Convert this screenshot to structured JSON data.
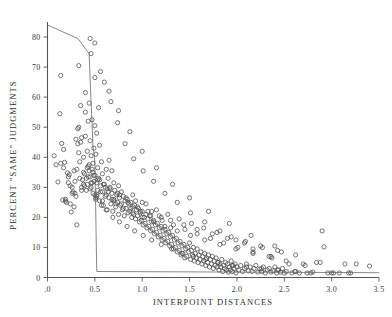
{
  "figure": {
    "background": "#ffffff",
    "marker_color": "#4a4a4a",
    "line_color": "#6a6a6a",
    "axis_color": "#555555"
  },
  "chart_data": {
    "type": "scatter",
    "title": "",
    "xlabel": "INTERPOINT  DISTANCES",
    "ylabel": "PERCENT \"SAME\" JUDGMENTS",
    "xlim": [
      0.0,
      3.5
    ],
    "ylim": [
      0,
      85
    ],
    "grid": false,
    "legend": null,
    "xticks": [
      0.0,
      0.5,
      1.0,
      1.5,
      2.0,
      2.5,
      3.0,
      3.5
    ],
    "xticklabels": [
      ".0",
      "0.5",
      "1.0",
      "1.5",
      "2.0",
      "2.5",
      "3.0",
      "3.5"
    ],
    "yticks": [
      0,
      10,
      20,
      30,
      40,
      50,
      60,
      70,
      80
    ],
    "yticklabels": [
      "0",
      "10",
      "20",
      "30",
      "40",
      "50",
      "60",
      "70",
      "80"
    ],
    "marker": "open-circle",
    "marker_size": 4.2,
    "series": [
      {
        "name": "observations",
        "x": [
          0.07,
          0.09,
          0.11,
          0.13,
          0.14,
          0.15,
          0.16,
          0.17,
          0.18,
          0.19,
          0.2,
          0.21,
          0.22,
          0.23,
          0.24,
          0.25,
          0.26,
          0.27,
          0.28,
          0.29,
          0.3,
          0.3,
          0.31,
          0.32,
          0.32,
          0.33,
          0.34,
          0.35,
          0.35,
          0.36,
          0.37,
          0.38,
          0.38,
          0.39,
          0.4,
          0.4,
          0.41,
          0.42,
          0.42,
          0.43,
          0.43,
          0.44,
          0.44,
          0.45,
          0.45,
          0.46,
          0.46,
          0.47,
          0.47,
          0.48,
          0.48,
          0.49,
          0.49,
          0.5,
          0.5,
          0.5,
          0.51,
          0.51,
          0.52,
          0.52,
          0.53,
          0.53,
          0.54,
          0.55,
          0.55,
          0.56,
          0.57,
          0.58,
          0.58,
          0.59,
          0.6,
          0.61,
          0.62,
          0.62,
          0.63,
          0.64,
          0.65,
          0.65,
          0.66,
          0.67,
          0.68,
          0.68,
          0.69,
          0.7,
          0.7,
          0.71,
          0.72,
          0.73,
          0.74,
          0.75,
          0.75,
          0.76,
          0.77,
          0.78,
          0.79,
          0.8,
          0.81,
          0.82,
          0.83,
          0.84,
          0.85,
          0.86,
          0.87,
          0.88,
          0.89,
          0.9,
          0.9,
          0.91,
          0.92,
          0.93,
          0.94,
          0.95,
          0.96,
          0.97,
          0.98,
          0.99,
          1.0,
          1.0,
          1.01,
          1.02,
          1.03,
          1.04,
          1.05,
          1.06,
          1.07,
          1.08,
          1.09,
          1.1,
          1.1,
          1.11,
          1.12,
          1.13,
          1.14,
          1.15,
          1.16,
          1.17,
          1.18,
          1.19,
          1.2,
          1.2,
          1.21,
          1.22,
          1.23,
          1.24,
          1.25,
          1.26,
          1.27,
          1.28,
          1.29,
          1.3,
          1.3,
          1.31,
          1.32,
          1.33,
          1.34,
          1.35,
          1.36,
          1.37,
          1.38,
          1.39,
          1.4,
          1.41,
          1.42,
          1.43,
          1.44,
          1.45,
          1.46,
          1.47,
          1.48,
          1.49,
          1.5,
          1.51,
          1.52,
          1.53,
          1.54,
          1.55,
          1.56,
          1.57,
          1.58,
          1.59,
          1.6,
          1.61,
          1.62,
          1.63,
          1.64,
          1.65,
          1.66,
          1.67,
          1.68,
          1.69,
          1.7,
          1.71,
          1.72,
          1.73,
          1.74,
          1.75,
          1.76,
          1.77,
          1.78,
          1.79,
          1.8,
          1.81,
          1.82,
          1.83,
          1.84,
          1.85,
          1.86,
          1.87,
          1.88,
          1.89,
          1.9,
          1.91,
          1.92,
          1.93,
          1.94,
          1.95,
          1.96,
          1.97,
          1.98,
          1.99,
          2.0,
          2.02,
          2.04,
          2.06,
          2.08,
          2.1,
          2.12,
          2.14,
          2.16,
          2.18,
          2.2,
          2.22,
          2.24,
          2.26,
          2.28,
          2.3,
          2.32,
          2.34,
          2.36,
          2.38,
          2.4,
          2.42,
          2.44,
          2.46,
          2.48,
          2.5,
          2.52,
          2.55,
          2.58,
          2.62,
          2.66,
          2.7,
          2.74,
          2.78,
          2.84,
          2.88,
          2.92,
          2.96,
          3.02,
          3.08,
          3.14,
          3.2,
          3.26,
          3.4,
          0.14,
          0.17,
          0.22,
          0.26,
          0.31,
          0.33,
          0.36,
          0.39,
          0.41,
          0.44,
          0.46,
          0.48,
          0.51,
          0.53,
          0.56,
          0.59,
          0.62,
          0.66,
          0.7,
          0.74,
          0.78,
          0.83,
          0.88,
          0.93,
          0.98,
          1.04,
          1.09,
          1.15,
          1.21,
          1.27,
          1.33,
          1.39,
          1.45,
          1.52,
          1.58,
          1.65,
          1.72,
          1.79,
          1.86,
          1.94,
          2.01,
          2.09,
          2.17,
          2.25,
          2.34,
          2.43,
          2.52,
          2.62,
          2.72,
          2.9,
          0.19,
          0.24,
          0.29,
          0.34,
          0.38,
          0.42,
          0.45,
          0.49,
          0.52,
          0.55,
          0.58,
          0.61,
          0.64,
          0.68,
          0.72,
          0.76,
          0.8,
          0.85,
          0.9,
          0.95,
          1.0,
          1.06,
          1.12,
          1.18,
          1.24,
          1.3,
          1.37,
          1.44,
          1.51,
          1.58,
          1.66,
          1.74,
          1.82,
          1.9,
          1.99,
          2.08,
          2.17,
          2.27,
          2.37,
          2.47,
          0.28,
          0.36,
          0.43,
          0.47,
          0.52,
          0.57,
          0.63,
          0.69,
          0.76,
          0.84,
          0.92,
          1.01,
          1.1,
          1.2,
          1.31,
          1.42,
          1.54,
          1.67,
          1.8,
          1.95,
          2.1,
          2.26,
          2.43,
          2.61,
          2.8,
          3.0,
          3.18,
          0.33,
          0.4,
          0.46,
          0.5,
          0.54,
          0.6,
          0.67,
          0.74,
          0.82,
          0.91,
          1.01,
          1.12,
          1.24,
          1.37,
          1.51,
          1.66,
          1.82,
          1.99,
          2.17,
          2.36,
          0.45,
          0.5,
          0.56,
          0.65,
          0.75,
          0.87,
          1.0,
          1.15,
          1.32,
          1.5,
          1.7,
          1.92,
          2.15,
          2.4
        ],
        "y": [
          40.5,
          37.5,
          31.8,
          54.5,
          67.2,
          44.6,
          25.8,
          42.6,
          38.3,
          25.4,
          25.0,
          34.8,
          31.5,
          34.2,
          24.5,
          21.8,
          30.0,
          28.5,
          35.5,
          32.0,
          27.0,
          46.0,
          17.5,
          44.5,
          49.5,
          50.0,
          38.5,
          45.0,
          57.2,
          46.5,
          32.5,
          40.0,
          35.0,
          30.5,
          55.0,
          47.0,
          33.0,
          31.0,
          42.0,
          52.0,
          37.0,
          35.5,
          58.0,
          33.5,
          45.5,
          40.5,
          30.0,
          36.0,
          52.5,
          28.0,
          38.0,
          32.0,
          43.0,
          27.5,
          34.0,
          50.5,
          26.0,
          41.0,
          31.5,
          48.0,
          36.5,
          29.0,
          33.0,
          25.5,
          44.0,
          30.5,
          38.5,
          28.5,
          34.5,
          24.0,
          31.0,
          27.0,
          36.0,
          22.5,
          29.5,
          33.0,
          26.5,
          39.0,
          30.0,
          24.5,
          28.0,
          35.5,
          22.0,
          31.5,
          26.0,
          29.0,
          23.5,
          27.5,
          25.0,
          30.5,
          21.0,
          26.5,
          24.0,
          28.5,
          22.5,
          27.0,
          20.5,
          25.5,
          23.0,
          26.0,
          21.5,
          24.5,
          22.0,
          25.0,
          20.0,
          23.5,
          27.5,
          21.0,
          24.0,
          19.5,
          22.5,
          20.5,
          23.0,
          18.5,
          21.5,
          19.0,
          22.0,
          25.0,
          17.5,
          20.0,
          18.0,
          21.0,
          16.5,
          19.5,
          17.0,
          20.5,
          15.5,
          18.5,
          22.0,
          16.0,
          19.0,
          14.5,
          17.5,
          15.0,
          18.0,
          13.5,
          16.5,
          14.0,
          17.0,
          20.0,
          12.5,
          15.5,
          13.0,
          16.0,
          11.5,
          14.5,
          12.0,
          15.0,
          10.5,
          13.5,
          16.5,
          11.0,
          14.0,
          9.5,
          12.5,
          10.0,
          13.0,
          8.5,
          11.5,
          9.0,
          12.0,
          7.5,
          10.5,
          8.0,
          11.0,
          6.5,
          9.5,
          7.0,
          10.0,
          8.5,
          11.5,
          6.0,
          9.0,
          7.5,
          10.0,
          5.5,
          8.0,
          6.5,
          9.5,
          5.0,
          7.5,
          6.0,
          8.5,
          4.5,
          7.0,
          5.5,
          8.0,
          4.0,
          6.5,
          5.0,
          7.5,
          3.5,
          6.0,
          4.5,
          7.0,
          3.0,
          5.5,
          4.0,
          6.5,
          3.5,
          5.0,
          2.5,
          4.5,
          3.5,
          6.0,
          2.0,
          4.0,
          3.0,
          5.0,
          2.5,
          4.5,
          1.8,
          3.5,
          2.5,
          5.5,
          2.0,
          4.0,
          3.0,
          4.5,
          1.5,
          3.5,
          2.5,
          4.0,
          2.0,
          3.0,
          4.5,
          2.2,
          3.5,
          2.0,
          3.0,
          4.0,
          1.8,
          2.8,
          2.0,
          3.5,
          1.5,
          2.5,
          3.0,
          1.8,
          2.2,
          3.5,
          1.5,
          2.5,
          1.8,
          3.0,
          1.5,
          2.0,
          4.5,
          1.5,
          2.0,
          1.5,
          4.5,
          1.5,
          1.5,
          5.0,
          5.0,
          10.2,
          1.5,
          1.5,
          1.5,
          4.5,
          1.5,
          4.5,
          3.8,
          38.0,
          36.5,
          33.5,
          28.0,
          36.0,
          41.5,
          30.0,
          34.5,
          29.0,
          37.5,
          31.5,
          35.0,
          26.5,
          32.5,
          28.5,
          31.0,
          27.5,
          29.5,
          25.5,
          28.0,
          24.5,
          26.5,
          23.0,
          25.5,
          22.0,
          24.5,
          20.5,
          22.5,
          19.0,
          21.0,
          17.5,
          19.5,
          16.0,
          18.0,
          14.5,
          16.5,
          13.0,
          15.0,
          11.5,
          13.5,
          10.0,
          12.0,
          8.5,
          10.5,
          7.0,
          9.0,
          5.5,
          7.5,
          4.0,
          15.5,
          26.0,
          30.5,
          28.0,
          33.0,
          31.0,
          36.5,
          29.5,
          34.0,
          27.0,
          32.5,
          25.5,
          30.0,
          28.5,
          26.0,
          24.5,
          27.5,
          23.0,
          25.0,
          21.5,
          23.5,
          20.0,
          22.0,
          18.5,
          20.5,
          17.0,
          19.0,
          15.5,
          17.5,
          14.0,
          16.0,
          12.5,
          14.5,
          11.0,
          13.0,
          9.5,
          11.5,
          8.0,
          10.0,
          6.5,
          8.5,
          23.5,
          29.0,
          33.5,
          31.5,
          27.5,
          24.0,
          22.5,
          20.0,
          18.5,
          17.0,
          15.5,
          14.0,
          12.5,
          11.0,
          9.5,
          8.0,
          7.0,
          6.0,
          5.0,
          4.0,
          3.5,
          3.0,
          2.5,
          2.0,
          1.8,
          1.5,
          1.5,
          70.5,
          61.5,
          74.5,
          66.5,
          56.5,
          65.0,
          58.5,
          51.5,
          44.5,
          39.5,
          35.5,
          32.0,
          28.0,
          25.0,
          21.5,
          18.5,
          15.5,
          12.5,
          9.5,
          7.0,
          79.5,
          78.0,
          68.5,
          62.0,
          55.5,
          48.5,
          42.0,
          36.5,
          31.0,
          26.5,
          22.0,
          18.0,
          14.0,
          10.5
        ]
      }
    ],
    "step_line": {
      "name": "fitted-step-function",
      "x": [
        0.0,
        0.32,
        0.32,
        0.44,
        0.44,
        0.45,
        0.45,
        0.455,
        0.455,
        0.47,
        0.47,
        0.48,
        0.48,
        0.5,
        0.5,
        0.52,
        0.52,
        3.5
      ],
      "y": [
        84.0,
        79.5,
        79.5,
        74.5,
        74.5,
        66.0,
        66.0,
        62.0,
        62.0,
        51.5,
        51.5,
        44.0,
        44.0,
        38.5,
        38.5,
        2.0,
        2.0,
        1.6
      ]
    }
  }
}
